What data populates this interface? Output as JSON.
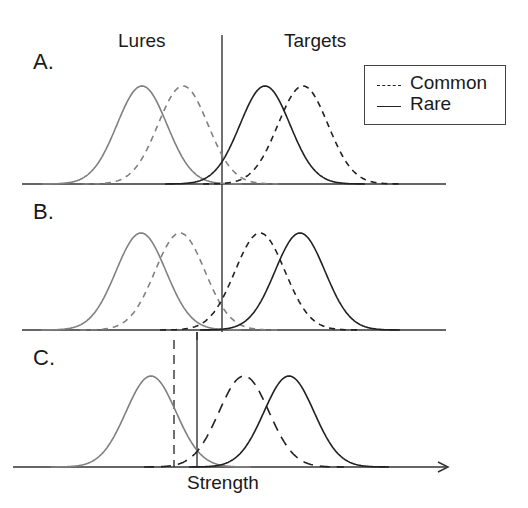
{
  "chart_data": {
    "type": "line",
    "title": "",
    "xlabel": "Strength",
    "ylabel": "",
    "column_labels": [
      "Lures",
      "Targets"
    ],
    "legend": [
      {
        "label": "Common",
        "style": "dashed"
      },
      {
        "label": "Rare",
        "style": "solid"
      }
    ],
    "panels": [
      {
        "label": "A.",
        "criterion_x": 222,
        "series": [
          {
            "name": "Lures Rare",
            "style": "solid",
            "color": "#808080",
            "mean": 142,
            "sd": 25
          },
          {
            "name": "Lures Common",
            "style": "dashed",
            "color": "#808080",
            "mean": 183,
            "sd": 25
          },
          {
            "name": "Targets Rare",
            "style": "solid",
            "color": "#222222",
            "mean": 265,
            "sd": 25
          },
          {
            "name": "Targets Common",
            "style": "dashed",
            "color": "#222222",
            "mean": 303,
            "sd": 25
          }
        ]
      },
      {
        "label": "B.",
        "criterion_x": 222,
        "series": [
          {
            "name": "Lures Rare",
            "style": "solid",
            "color": "#808080",
            "mean": 141,
            "sd": 25
          },
          {
            "name": "Lures Common",
            "style": "dashed",
            "color": "#808080",
            "mean": 180,
            "sd": 25
          },
          {
            "name": "Targets Common",
            "style": "dashed",
            "color": "#222222",
            "mean": 260,
            "sd": 25
          },
          {
            "name": "Targets Rare",
            "style": "solid",
            "color": "#222222",
            "mean": 300,
            "sd": 25
          }
        ]
      },
      {
        "label": "C.",
        "criterion_rare_x": 197,
        "criterion_common_x": 174,
        "series": [
          {
            "name": "Lures",
            "style": "solid",
            "color": "#808080",
            "mean": 151,
            "sd": 25
          },
          {
            "name": "Targets Common",
            "style": "dashed",
            "color": "#222222",
            "mean": 244,
            "sd": 25
          },
          {
            "name": "Targets Rare",
            "style": "solid",
            "color": "#222222",
            "mean": 289,
            "sd": 25
          }
        ]
      }
    ]
  },
  "labels": {
    "lures": "Lures",
    "targets": "Targets",
    "panel_a": "A.",
    "panel_b": "B.",
    "panel_c": "C.",
    "x_axis": "Strength"
  },
  "legend": {
    "common": "Common",
    "rare": "Rare"
  },
  "colors": {
    "lure": "#808080",
    "target": "#222222",
    "axis": "#333333"
  }
}
